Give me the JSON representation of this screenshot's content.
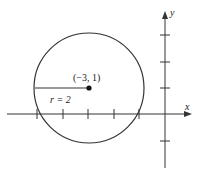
{
  "diagram": {
    "type": "circle-on-coordinate-plane",
    "colors": {
      "stroke": "#333333",
      "background": "#ffffff"
    },
    "axes": {
      "x_label": "x",
      "y_label": "y",
      "x_ticks": [
        -5,
        -4,
        -3,
        -2,
        -1
      ],
      "y_ticks": [
        -1,
        1,
        2,
        3
      ]
    },
    "circle": {
      "center_label": "(−3, 1)",
      "center": [
        -3,
        1
      ],
      "radius": 2,
      "radius_label": "r = 2"
    }
  }
}
